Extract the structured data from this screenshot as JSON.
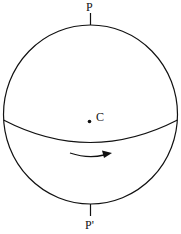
{
  "diagram": {
    "labels": {
      "north_pole": "P",
      "south_pole": "P'",
      "center": "C"
    },
    "rotation_direction": "left-to-right across front of equator",
    "stroke_color": "#111111",
    "background": "#ffffff"
  }
}
